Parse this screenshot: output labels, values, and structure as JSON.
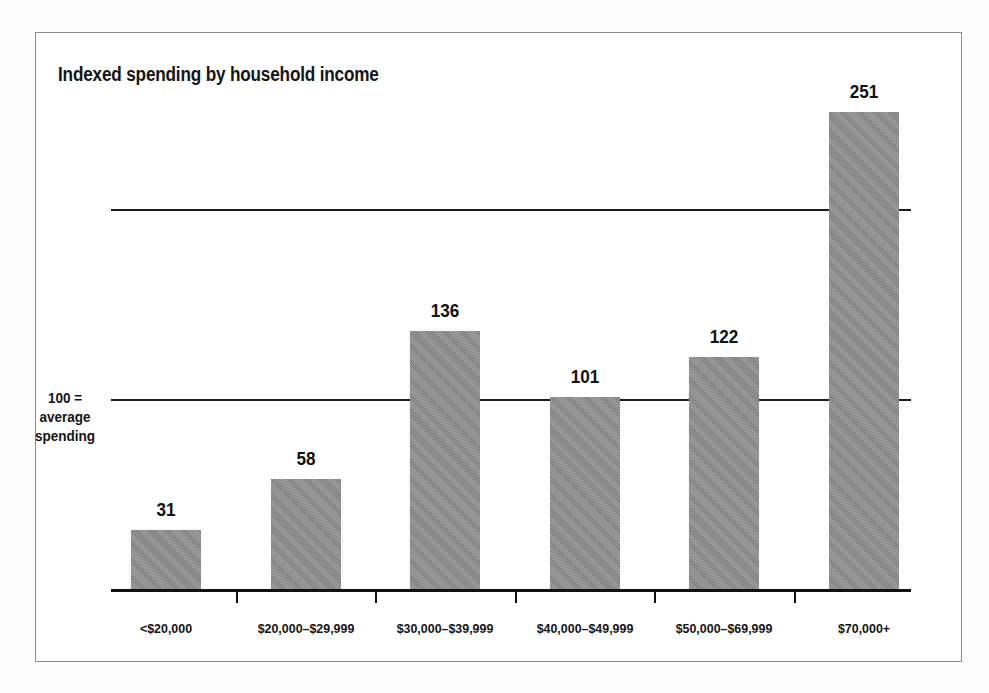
{
  "chart_data": {
    "type": "bar",
    "title": "Indexed spending by household income",
    "xlabel": "",
    "ylabel": "",
    "categories": [
      "<$20,000",
      "$20,000–$29,999",
      "$30,000–$39,999",
      "$40,000–$49,999",
      "$50,000–$69,999",
      "$70,000+"
    ],
    "values": [
      31,
      58,
      136,
      101,
      122,
      251
    ],
    "value_labels": [
      "31",
      "58",
      "136",
      "101",
      "122",
      "251"
    ],
    "ylim": [
      0,
      265
    ],
    "gridlines": [
      100,
      200
    ],
    "grid": true,
    "legend": null,
    "annotations": [
      {
        "target_value": 100,
        "lines": [
          "100 =",
          "average",
          "spending"
        ]
      }
    ],
    "colors": {
      "bar_fill": "#8b8b8b",
      "axis": "#111111",
      "gridline": "#1c1c1c",
      "text": "#141414",
      "frame_border": "#8e8e8e",
      "plot_background": "#ffffff",
      "figure_background": "#fdfdfd"
    }
  }
}
